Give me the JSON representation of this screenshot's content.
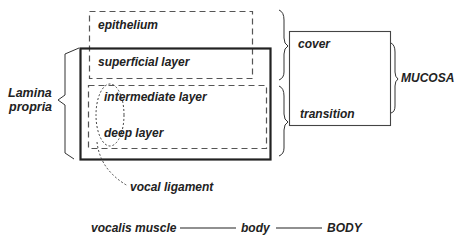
{
  "diagram": {
    "colors": {
      "line": "#333333",
      "text": "#222222",
      "background": "#ffffff"
    },
    "layers": {
      "epithelium": "epithelium",
      "superficial": "superficial layer",
      "intermediate": "intermediate layer",
      "deep": "deep layer"
    },
    "groups": {
      "lamina_propria_line1": "Lamina",
      "lamina_propria_line2": "propria",
      "vocal_ligament": "vocal ligament",
      "cover": "cover",
      "transition": "transition",
      "mucosa": "MUCOSA"
    },
    "bottom_row": {
      "vocalis": "vocalis muscle",
      "body": "body",
      "body_upper": "BODY"
    }
  }
}
